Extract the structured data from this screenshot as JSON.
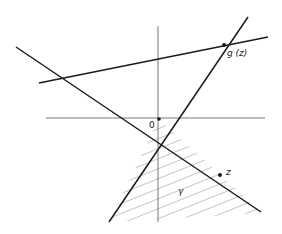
{
  "figure": {
    "labels": {
      "origin": "0",
      "g_of_z": "g (z)",
      "z": "z",
      "cone": "γ"
    },
    "colors": {
      "line": "#1a1a1a",
      "axis": "#555555",
      "hatch": "#9a9a9a"
    }
  }
}
